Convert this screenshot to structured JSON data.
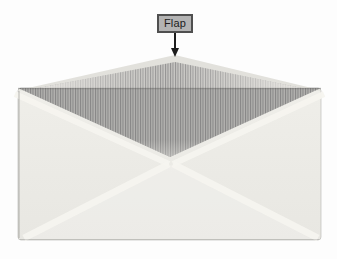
{
  "figure": {
    "type": "envelope-flap-diagram",
    "label": "Flap"
  },
  "colors": {
    "background": "#fdfdfd",
    "body": "#e8e7e2",
    "body_light": "#efeee9",
    "edge_highlight": "#f5f4ef",
    "flap_paper_edge": "#e2e1dc",
    "stripe_dark": "#8f8f8f",
    "stripe_light": "#c7c6c3",
    "label_bg": "#b3b3b3",
    "label_border": "#4f4f4f",
    "label_text": "#1c1c1c",
    "arrow": "#1c1c1c"
  }
}
